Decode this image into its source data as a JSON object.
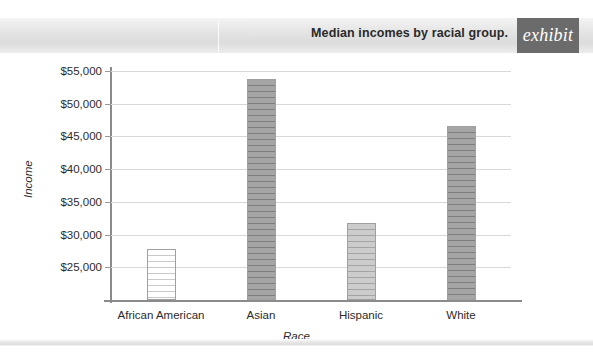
{
  "header": {
    "title": "Median incomes by racial group.",
    "badge_label": "exhibit"
  },
  "chart_data": {
    "type": "bar",
    "title": "Median incomes by racial group.",
    "categories": [
      "African American",
      "Asian",
      "Hispanic",
      "White"
    ],
    "values": [
      27800,
      53800,
      31800,
      46600
    ],
    "xlabel": "Race",
    "ylabel": "Income",
    "ylim": [
      20000,
      55000
    ],
    "ytick_values": [
      25000,
      30000,
      35000,
      40000,
      45000,
      50000,
      55000
    ],
    "ytick_labels": [
      "$25,000",
      "$30,000",
      "$35,000",
      "$40,000",
      "$45,000",
      "$50,000",
      "$55,000"
    ],
    "grid": true,
    "legend": "none",
    "bar_styles": [
      "light-striped",
      "dark-striped",
      "mid-striped",
      "dark-striped"
    ],
    "colors": {
      "bar_light": "#ffffff",
      "bar_mid": "#c2c2c2",
      "bar_dark": "#9b9b9b",
      "bar_border": "#a0a0a0",
      "gridline": "#d8d8d8",
      "axis": "#8b8b8b",
      "text": "#2b2b2b",
      "badge_background": "#6b6b6b"
    }
  }
}
